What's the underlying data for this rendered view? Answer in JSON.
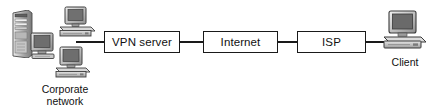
{
  "diagram": {
    "background_color": "#ffffff",
    "line_color": "#1a1a1a",
    "text_color": "#111111",
    "nodes": [
      {
        "id": "vpn-server",
        "label": "VPN server",
        "type": "box"
      },
      {
        "id": "internet",
        "label": "Internet",
        "type": "box"
      },
      {
        "id": "isp",
        "label": "ISP",
        "type": "box"
      }
    ],
    "captions": [
      {
        "id": "corporate-network",
        "label": "Corporate\nnetwork"
      },
      {
        "id": "client",
        "label": "Client"
      }
    ],
    "icons": [
      {
        "id": "server-tower-icon",
        "name": "server-tower-icon"
      },
      {
        "id": "desktop-monitor-icon",
        "name": "desktop-monitor-icon"
      },
      {
        "id": "workstation-top-icon",
        "name": "workstation-top-icon"
      },
      {
        "id": "workstation-bottom-icon",
        "name": "workstation-bottom-icon"
      },
      {
        "id": "client-computer-icon",
        "name": "client-computer-icon"
      }
    ],
    "links": [
      {
        "from": "corporate-network",
        "to": "vpn-server"
      },
      {
        "from": "vpn-server",
        "to": "internet"
      },
      {
        "from": "internet",
        "to": "isp"
      },
      {
        "from": "isp",
        "to": "client"
      }
    ]
  }
}
